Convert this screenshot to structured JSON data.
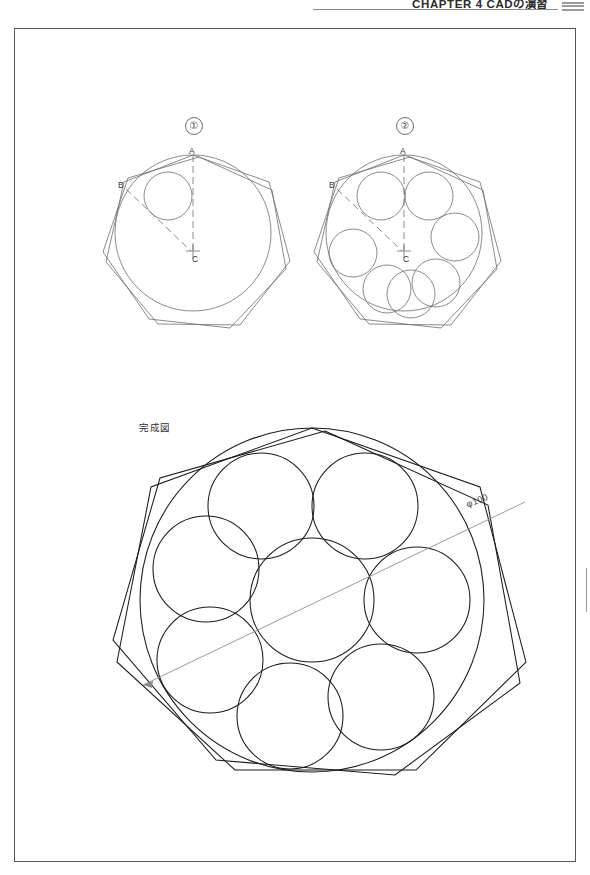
{
  "header": {
    "title": "CHAPTER 4  CADの演習",
    "thumb_index_icon": "page-index-icon",
    "rule_color": "#8c8c8c"
  },
  "page": {
    "frame_color": "#555555",
    "background": "#ffffff",
    "width": 590,
    "height": 875
  },
  "steps": [
    {
      "id": "step-1",
      "number": "①",
      "labels": {
        "a": "A",
        "b": "B",
        "c": "C"
      },
      "description_geometry": {
        "outer_circle_r": 78,
        "polygon_sides": 7,
        "small_circles": 1
      }
    },
    {
      "id": "step-2",
      "number": "②",
      "labels": {
        "a": "A",
        "b": "B",
        "c": "C"
      },
      "description_geometry": {
        "outer_circle_r": 78,
        "polygon_sides": 7,
        "small_circles": 7
      }
    }
  ],
  "final_figure": {
    "caption": "完成図",
    "dimension_label": "φ100",
    "dimension_line_color": "#8a8a8a",
    "line_color": "#1a1a1a",
    "circle_count_ring": 7,
    "circle_count_center": 1,
    "polygon_sides": 7
  },
  "colors": {
    "line_dark": "#1a1a1a",
    "line_medium": "#6f6f6f",
    "line_light": "#9b9b9b",
    "text": "#333333"
  }
}
